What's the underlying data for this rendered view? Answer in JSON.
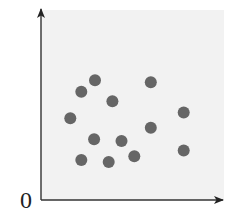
{
  "chart_data": {
    "type": "scatter",
    "title": "",
    "xlabel": "",
    "ylabel": "",
    "origin_label": "0",
    "xlim": [
      0,
      10
    ],
    "ylim": [
      0,
      10
    ],
    "grid": false,
    "legend": null,
    "axes": {
      "x_arrow": true,
      "y_arrow": true,
      "tick_labels": []
    },
    "series": [
      {
        "name": "points",
        "color": "#666666",
        "points": [
          {
            "x": 2.95,
            "y": 6.3
          },
          {
            "x": 2.2,
            "y": 5.7
          },
          {
            "x": 3.9,
            "y": 5.2
          },
          {
            "x": 1.6,
            "y": 4.3
          },
          {
            "x": 6.0,
            "y": 6.2
          },
          {
            "x": 7.8,
            "y": 4.6
          },
          {
            "x": 6.0,
            "y": 3.8
          },
          {
            "x": 2.9,
            "y": 3.2
          },
          {
            "x": 4.4,
            "y": 3.1
          },
          {
            "x": 5.1,
            "y": 2.3
          },
          {
            "x": 2.2,
            "y": 2.1
          },
          {
            "x": 3.7,
            "y": 2.0
          },
          {
            "x": 7.8,
            "y": 2.6
          }
        ]
      }
    ],
    "plot_background": "#f2f2f2",
    "axis_color": "#333333"
  }
}
